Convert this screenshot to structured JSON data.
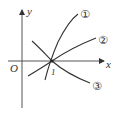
{
  "diagram": {
    "axes": {
      "x_label": "x",
      "y_label": "y",
      "origin_label": "O",
      "tick_label": "1"
    },
    "curves": [
      {
        "id": "curve-1",
        "label": "①"
      },
      {
        "id": "curve-2",
        "label": "②"
      },
      {
        "id": "curve-3",
        "label": "③"
      }
    ],
    "colors": {
      "stroke": "#333333",
      "background": "#ffffff"
    }
  }
}
